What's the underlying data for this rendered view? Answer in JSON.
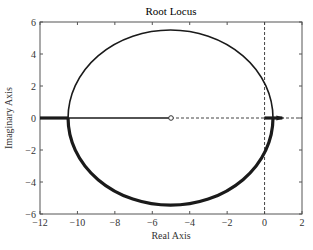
{
  "chart_data": {
    "type": "line",
    "title": "Root Locus",
    "xlabel": "Real Axis",
    "ylabel": "Imaginary Axis",
    "xlim": [
      -12,
      2
    ],
    "ylim": [
      -6,
      6
    ],
    "xticks": [
      -12,
      -10,
      -8,
      -6,
      -4,
      -2,
      0,
      2
    ],
    "yticks": [
      -6,
      -4,
      -2,
      0,
      2,
      4,
      6
    ],
    "xtick_labels": [
      "-12",
      "-10",
      "-8",
      "-6",
      "-4",
      "-2",
      "0",
      "2"
    ],
    "ytick_labels": [
      "-6",
      "-4",
      "-2",
      "0",
      "2",
      "4",
      "6"
    ],
    "grid": false,
    "legend": null,
    "reference_lines": [
      {
        "orientation": "vertical",
        "x": 0,
        "style": "dashed"
      },
      {
        "orientation": "horizontal",
        "y": 0,
        "style": "dashed"
      }
    ],
    "zeros": [
      {
        "re": -5,
        "im": 0,
        "marker": "o"
      }
    ],
    "series": [
      {
        "name": "locus-circle-upper",
        "description": "Upper half of circular locus branch",
        "center": [
          -5,
          0
        ],
        "radius_re": 5.5,
        "radius_im": 5.5,
        "crossings_real_axis": [
          -10.5,
          0.45
        ],
        "line_width": "thin"
      },
      {
        "name": "locus-circle-lower",
        "description": "Lower half of circular locus branch",
        "center": [
          -5,
          0
        ],
        "radius_re": 5.5,
        "radius_im": 5.45,
        "line_width": "thick"
      },
      {
        "name": "real-axis-left-thick",
        "x": [
          -12,
          -10.5
        ],
        "y": [
          0,
          0
        ],
        "line_width": "thick"
      },
      {
        "name": "real-axis-segment-to-zero",
        "x": [
          -10.5,
          -5
        ],
        "y": [
          0,
          0
        ],
        "line_width": "thin"
      },
      {
        "name": "real-axis-right-thick",
        "x": [
          0,
          0.95
        ],
        "y": [
          0,
          0
        ],
        "line_width": "thick"
      }
    ]
  },
  "plot": {
    "title": "Root Locus",
    "xlabel": "Real Axis",
    "ylabel": "Imaginary Axis"
  }
}
